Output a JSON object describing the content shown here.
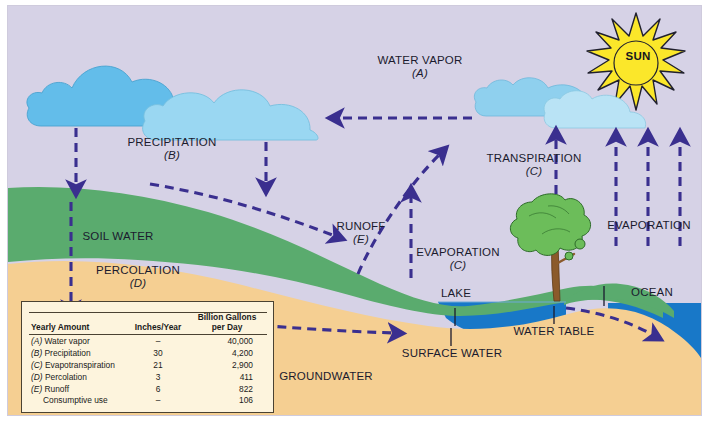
{
  "diagram": {
    "sky_color": "#d6d2e6",
    "arrow_color": "#3a2f8f",
    "soil_color": "#5aab6e",
    "groundwater_color": "#f5cf92",
    "water_color": "#1878c8",
    "sun_color": "#fbe72a"
  },
  "labels": {
    "water_vapor": {
      "main": "WATER VAPOR",
      "sub": "(A)"
    },
    "precipitation": {
      "main": "PRECIPITATION",
      "sub": "(B)"
    },
    "soil_water": {
      "main": "SOIL WATER",
      "sub": ""
    },
    "percolation": {
      "main": "PERCOLATION",
      "sub": "(D)"
    },
    "runoff": {
      "main": "RUNOFF",
      "sub": "(E)"
    },
    "evaporation_mid": {
      "main": "EVAPORATION",
      "sub": "(C)"
    },
    "transpiration": {
      "main": "TRANSPIRATION",
      "sub": "(C)"
    },
    "evaporation_right": {
      "main": "EVAPORATION",
      "sub": ""
    },
    "sun": {
      "main": "SUN",
      "sub": ""
    },
    "lake": {
      "main": "LAKE",
      "sub": ""
    },
    "ocean": {
      "main": "OCEAN",
      "sub": ""
    },
    "surface_water": {
      "main": "SURFACE WATER",
      "sub": ""
    },
    "water_table": {
      "main": "WATER TABLE",
      "sub": ""
    },
    "groundwater": {
      "main": "GROUNDWATER",
      "sub": ""
    }
  },
  "table": {
    "headers": [
      "Yearly Amount",
      "Inches/Year",
      "Billion Gallons per Day"
    ],
    "header_col3_line1": "Billion Gallons",
    "header_col3_line2": "per Day",
    "rows": [
      {
        "key": "(A)",
        "name": "Water vapor",
        "inches": "–",
        "gallons": "40,000"
      },
      {
        "key": "(B)",
        "name": "Precipitation",
        "inches": "30",
        "gallons": "4,200"
      },
      {
        "key": "(C)",
        "name": "Evapotranspiration",
        "inches": "21",
        "gallons": "2,900"
      },
      {
        "key": "(D)",
        "name": "Percolation",
        "inches": "3",
        "gallons": "411"
      },
      {
        "key": "(E)",
        "name": "Runoff",
        "inches": "6",
        "gallons": "822"
      },
      {
        "key": "",
        "name": "Consumptive use",
        "inches": "–",
        "gallons": "106"
      }
    ]
  }
}
